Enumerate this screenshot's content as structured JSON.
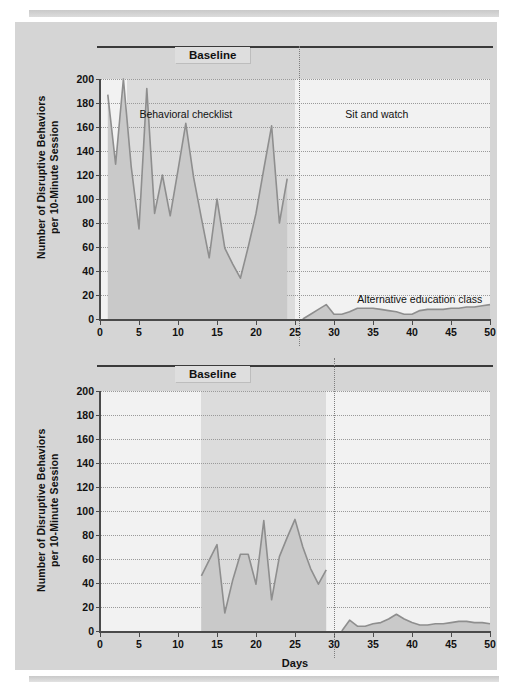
{
  "figure": {
    "xlabel": "Days",
    "ylabel_line1": "Number of Disruptive Behaviors",
    "ylabel_line2": "per 10-Minute Session",
    "accent_line": "#8e8e8e",
    "fill_color": "#c9c9c9",
    "panel_bg": "#d5d5d5",
    "plot_bg": "#f2f2f2"
  },
  "chart_data": [
    {
      "type": "line",
      "id": "top-panel",
      "title": "",
      "xlabel": "",
      "ylabel": "Number of Disruptive Behaviors per 10-Minute Session",
      "xlim": [
        0,
        50
      ],
      "ylim": [
        0,
        200
      ],
      "xticks": [
        0,
        5,
        10,
        15,
        20,
        25,
        30,
        35,
        40,
        45,
        50
      ],
      "yticks": [
        0,
        20,
        40,
        60,
        80,
        100,
        120,
        140,
        160,
        180,
        200
      ],
      "grid": true,
      "phase_label": "Baseline",
      "phase_annotations": [
        {
          "text": "Behavioral checklist",
          "x": 11
        },
        {
          "text": "Sit and watch",
          "x": 35
        },
        {
          "text": "Alternative education class",
          "x": 41
        }
      ],
      "phase_change_day": 25.5,
      "baseline_shade_range": [
        3.5,
        25
      ],
      "series": [
        {
          "name": "Disruptive behaviors (top panel)",
          "x": [
            1,
            2,
            3,
            4,
            5,
            6,
            7,
            8,
            9,
            10,
            11,
            12,
            13,
            14,
            15,
            16,
            17,
            18,
            19,
            20,
            21,
            22,
            23,
            24,
            26,
            27,
            28,
            29,
            30,
            31,
            32,
            33,
            34,
            35,
            36,
            37,
            38,
            39,
            40,
            41,
            42,
            43,
            44,
            45,
            46,
            47,
            48,
            49,
            50
          ],
          "y": [
            187,
            129,
            200,
            127,
            75,
            192,
            88,
            120,
            86,
            124,
            163,
            118,
            84,
            51,
            100,
            59,
            46,
            34,
            60,
            88,
            125,
            161,
            80,
            117,
            0,
            4,
            8,
            12,
            4,
            4,
            6,
            9,
            9,
            9,
            8,
            7,
            6,
            4,
            4,
            7,
            8,
            8,
            8,
            9,
            9,
            10,
            10,
            11,
            12
          ]
        }
      ]
    },
    {
      "type": "line",
      "id": "bottom-panel",
      "title": "",
      "xlabel": "Days",
      "ylabel": "Number of Disruptive Behaviors per 10-Minute Session",
      "xlim": [
        0,
        50
      ],
      "ylim": [
        0,
        200
      ],
      "xticks": [
        0,
        5,
        10,
        15,
        20,
        25,
        30,
        35,
        40,
        45,
        50
      ],
      "yticks": [
        0,
        20,
        40,
        60,
        80,
        100,
        120,
        140,
        160,
        180,
        200
      ],
      "grid": true,
      "phase_label": "Baseline",
      "phase_annotations": [
        {
          "text": "Fourth-grade class",
          "x": 40
        }
      ],
      "phase_change_day": 30,
      "baseline_shade_range": [
        13,
        29
      ],
      "series": [
        {
          "name": "Disruptive behaviors (bottom panel)",
          "x": [
            13,
            14,
            15,
            16,
            17,
            18,
            19,
            20,
            21,
            22,
            23,
            24,
            25,
            26,
            27,
            28,
            29,
            31,
            32,
            33,
            34,
            35,
            36,
            37,
            38,
            39,
            40,
            41,
            42,
            43,
            44,
            45,
            46,
            47,
            48,
            49,
            50
          ],
          "y": [
            46,
            59,
            72,
            15,
            42,
            64,
            64,
            39,
            92,
            26,
            62,
            78,
            93,
            70,
            52,
            39,
            51,
            0,
            9,
            4,
            4,
            6,
            7,
            10,
            14,
            10,
            7,
            5,
            5,
            6,
            6,
            7,
            8,
            8,
            7,
            7,
            6
          ]
        }
      ]
    }
  ]
}
